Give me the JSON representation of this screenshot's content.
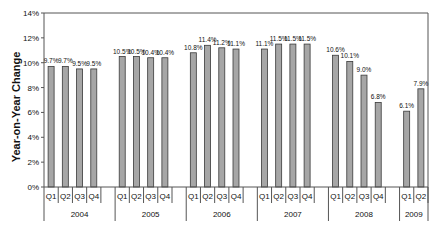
{
  "chart_data": {
    "type": "bar",
    "title": "",
    "xlabel": "",
    "ylabel": "Year-on-Year Change",
    "ylim": [
      0,
      14
    ],
    "yticks": [
      "0%",
      "2%",
      "4%",
      "6%",
      "8%",
      "10%",
      "12%",
      "14%"
    ],
    "grid": false,
    "legend": "none",
    "groups": [
      {
        "year": "2004",
        "quarters": [
          "Q1",
          "Q2",
          "Q3",
          "Q4"
        ],
        "values": [
          9.7,
          9.7,
          9.5,
          9.5
        ],
        "labels": [
          "9.7%",
          "9.7%",
          "9.5%",
          "9.5%"
        ]
      },
      {
        "year": "2005",
        "quarters": [
          "Q1",
          "Q2",
          "Q3",
          "Q4"
        ],
        "values": [
          10.5,
          10.5,
          10.4,
          10.4
        ],
        "labels": [
          "10.5%",
          "10.5%",
          "10.4%",
          "10.4%"
        ]
      },
      {
        "year": "2006",
        "quarters": [
          "Q1",
          "Q2",
          "Q3",
          "Q4"
        ],
        "values": [
          10.8,
          11.4,
          11.2,
          11.1
        ],
        "labels": [
          "10.8%",
          "11.4%",
          "11.2%",
          "11.1%"
        ]
      },
      {
        "year": "2007",
        "quarters": [
          "Q1",
          "Q2",
          "Q3",
          "Q4"
        ],
        "values": [
          11.1,
          11.5,
          11.5,
          11.5
        ],
        "labels": [
          "11.1%",
          "11.5%",
          "11.5%",
          "11.5%"
        ]
      },
      {
        "year": "2008",
        "quarters": [
          "Q1",
          "Q2",
          "Q3",
          "Q4"
        ],
        "values": [
          10.6,
          10.1,
          9.0,
          6.8
        ],
        "labels": [
          "10.6%",
          "10.1%",
          "9.0%",
          "6.8%"
        ]
      },
      {
        "year": "2009",
        "quarters": [
          "Q1",
          "Q2"
        ],
        "values": [
          6.1,
          7.9
        ],
        "labels": [
          "6.1%",
          "7.9%"
        ]
      }
    ],
    "categories": [
      "2004 Q1",
      "2004 Q2",
      "2004 Q3",
      "2004 Q4",
      "2005 Q1",
      "2005 Q2",
      "2005 Q3",
      "2005 Q4",
      "2006 Q1",
      "2006 Q2",
      "2006 Q3",
      "2006 Q4",
      "2007 Q1",
      "2007 Q2",
      "2007 Q3",
      "2007 Q4",
      "2008 Q1",
      "2008 Q2",
      "2008 Q3",
      "2008 Q4",
      "2009 Q1",
      "2009 Q2"
    ],
    "values": [
      9.7,
      9.7,
      9.5,
      9.5,
      10.5,
      10.5,
      10.4,
      10.4,
      10.8,
      11.4,
      11.2,
      11.1,
      11.1,
      11.5,
      11.5,
      11.5,
      10.6,
      10.1,
      9.0,
      6.8,
      6.1,
      7.9
    ]
  },
  "colors": {
    "bar_fill": "#a6a6a6",
    "bar_stroke": "#3a3a3a",
    "axis": "#555555",
    "text": "#111111"
  }
}
